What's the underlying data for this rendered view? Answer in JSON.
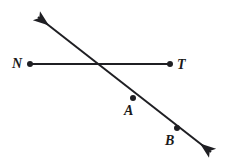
{
  "figure": {
    "type": "geometry-diagram",
    "background_color": "#ffffff",
    "stroke_color": "#1f1f23",
    "canvas": {
      "width": 229,
      "height": 168
    },
    "labels": {
      "n": "N",
      "t": "T",
      "a": "A",
      "b": "B"
    },
    "points": [
      {
        "name": "N",
        "label": "N",
        "x": 30,
        "y": 64,
        "marker": "filled-dot",
        "label_position": "left"
      },
      {
        "name": "T",
        "label": "T",
        "x": 170,
        "y": 64,
        "marker": "filled-dot",
        "label_position": "right"
      },
      {
        "name": "A",
        "label": "A",
        "x": 133,
        "y": 98,
        "marker": "filled-dot",
        "label_position": "below-left"
      },
      {
        "name": "B",
        "label": "B",
        "x": 177,
        "y": 128,
        "marker": "filled-dot",
        "label_position": "below-left"
      }
    ],
    "segments": [
      {
        "name": "segment-NT",
        "from": {
          "x": 30,
          "y": 64
        },
        "to": {
          "x": 170,
          "y": 64
        },
        "arrow_start": false,
        "arrow_end": false,
        "stroke_width": 2
      },
      {
        "name": "line-AB",
        "from": {
          "x": 32,
          "y": 11
        },
        "to": {
          "x": 218,
          "y": 158
        },
        "arrow_start": true,
        "arrow_end": true,
        "stroke_width": 2
      }
    ],
    "intersection": {
      "x": 93,
      "y": 64
    }
  }
}
